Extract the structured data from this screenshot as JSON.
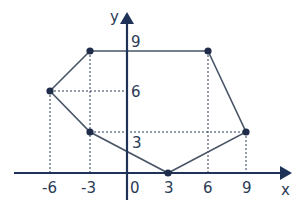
{
  "diagram": {
    "type": "coordinate-polygon",
    "axes": {
      "x_label": "x",
      "y_label": "y",
      "origin_label": "0",
      "x_ticks": [
        {
          "value": -6,
          "label": "-6"
        },
        {
          "value": -3,
          "label": "-3"
        },
        {
          "value": 3,
          "label": "3"
        },
        {
          "value": 6,
          "label": "6"
        },
        {
          "value": 9,
          "label": "9"
        }
      ],
      "y_ticks": [
        {
          "value": 3,
          "label": "3"
        },
        {
          "value": 6,
          "label": "6"
        },
        {
          "value": 9,
          "label": "9"
        }
      ]
    },
    "vertices": [
      {
        "x": -3,
        "y": 9
      },
      {
        "x": 6,
        "y": 9
      },
      {
        "x": 9,
        "y": 3.5
      },
      {
        "x": 3,
        "y": 0
      },
      {
        "x": -3,
        "y": 3.5
      },
      {
        "x": -6,
        "y": 6
      }
    ],
    "colors": {
      "axis": "#1f3359",
      "polygon": "#4a5568",
      "dashed": "#2b3a55",
      "point": "#1f2d4a"
    }
  }
}
